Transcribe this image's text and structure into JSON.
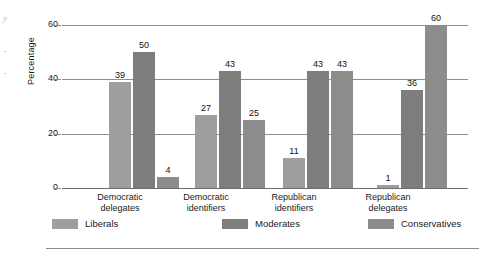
{
  "chart_data": {
    "type": "bar",
    "title": "",
    "xlabel": "",
    "ylabel": "Percentage",
    "ylim": [
      0,
      60
    ],
    "yticks": [
      0,
      20,
      40,
      60
    ],
    "ytick_labels": [
      "0",
      "20",
      "40",
      "60"
    ],
    "grid": true,
    "legend_position": "bottom",
    "categories": [
      "Democratic delegates",
      "Democratic identifiers",
      "Republican identifiers",
      "Republican delegates"
    ],
    "category_lines": [
      [
        "Democratic",
        "delegates"
      ],
      [
        "Democratic",
        "identifiers"
      ],
      [
        "Republican",
        "identifiers"
      ],
      [
        "Republican",
        "delegates"
      ]
    ],
    "series": [
      {
        "name": "Liberals",
        "color": "#9e9e9e",
        "values": [
          39,
          27,
          11,
          1
        ]
      },
      {
        "name": "Moderates",
        "color": "#7d7d7d",
        "values": [
          50,
          43,
          43,
          36
        ]
      },
      {
        "name": "Conservatives",
        "color": "#8c8c8c",
        "values": [
          4,
          25,
          43,
          60
        ]
      }
    ]
  },
  "legend": {
    "items": [
      {
        "label": "Liberals",
        "color": "#9e9e9e"
      },
      {
        "label": "Moderates",
        "color": "#7d7d7d"
      },
      {
        "label": "Conservatives",
        "color": "#8c8c8c"
      }
    ]
  },
  "scan_artifacts": {
    "mark_1": "y",
    "mark_2": "-",
    "mark_3": "-"
  }
}
